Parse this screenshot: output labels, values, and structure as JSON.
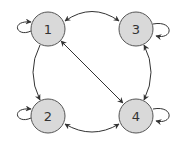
{
  "diagram": {
    "type": "directed-graph",
    "node_fill": "#d9d9d9",
    "node_stroke": "#555555",
    "edge_color": "#333333",
    "nodes": [
      {
        "id": "1",
        "label": "1",
        "x": 48,
        "y": 29
      },
      {
        "id": "2",
        "label": "2",
        "x": 48,
        "y": 116
      },
      {
        "id": "3",
        "label": "3",
        "x": 136,
        "y": 29
      },
      {
        "id": "4",
        "label": "4",
        "x": 136,
        "y": 116
      }
    ],
    "edges": [
      {
        "from": "1",
        "to": "1",
        "kind": "self-loop"
      },
      {
        "from": "2",
        "to": "2",
        "kind": "self-loop"
      },
      {
        "from": "3",
        "to": "3",
        "kind": "self-loop"
      },
      {
        "from": "4",
        "to": "4",
        "kind": "self-loop"
      },
      {
        "from": "1",
        "to": "3",
        "kind": "bidirectional"
      },
      {
        "from": "1",
        "to": "2",
        "kind": "directed"
      },
      {
        "from": "1",
        "to": "4",
        "kind": "bidirectional"
      },
      {
        "from": "3",
        "to": "4",
        "kind": "bidirectional"
      },
      {
        "from": "2",
        "to": "4",
        "kind": "bidirectional"
      }
    ]
  }
}
